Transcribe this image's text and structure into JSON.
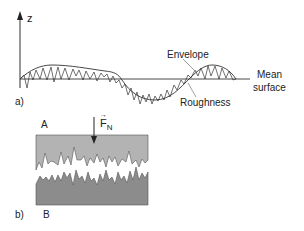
{
  "panel_a": {
    "tag": "a)",
    "axis_label": "z",
    "envelope_label": "Envelope",
    "roughness_label": "Roughness",
    "mean_surface_label_line1": "Mean",
    "mean_surface_label_line2": "surface"
  },
  "panel_b": {
    "tag": "b)",
    "upper_body_label": "A",
    "lower_body_label": "B",
    "force_label": "F",
    "force_subscript": "N",
    "force_vector_mark": "→"
  },
  "colors": {
    "line": "#333333",
    "upper_body": "#b3b3b3",
    "lower_body": "#8c8c8c",
    "leader": "#888888"
  }
}
